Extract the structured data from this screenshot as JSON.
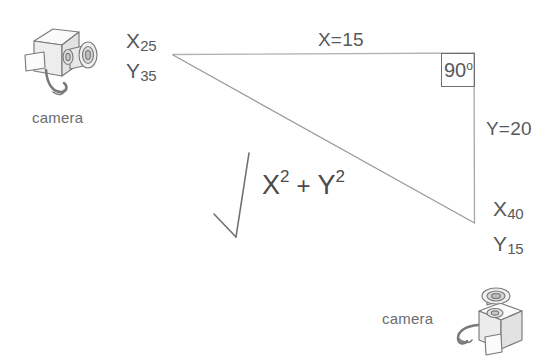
{
  "diagram": {
    "background_color": "#ffffff",
    "line_color": "#a0a0a2",
    "text_color": "#58595b"
  },
  "vertices": {
    "top_left": {
      "x_label": "X",
      "x_value": "25",
      "y_label": "Y",
      "y_value": "35"
    },
    "bottom_right": {
      "x_label": "X",
      "x_value": "40",
      "y_label": "Y",
      "y_value": "15"
    }
  },
  "segments": {
    "top": "X=15",
    "right": "Y=20"
  },
  "angle": {
    "value": "90",
    "unit": "o"
  },
  "formula": {
    "term1": "X",
    "exp1": "2",
    "operator": "+",
    "term2": "Y",
    "exp2": "2",
    "radical": "square-root-sign"
  },
  "cameras": [
    {
      "caption": "camera",
      "position": "top-left",
      "icon": "camera-icon"
    },
    {
      "caption": "camera",
      "position": "bottom-right",
      "icon": "camera-icon"
    }
  ]
}
